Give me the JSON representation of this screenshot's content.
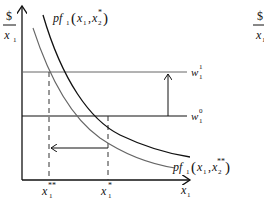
{
  "diagram": {
    "y_axis_label": {
      "numerator": "$",
      "denominator": "x",
      "denominator_sub": "1"
    },
    "x_axis_label": {
      "base": "x",
      "sub": "1"
    },
    "curves": [
      {
        "name": "pf1(x1, x2*)",
        "prefix": "pf",
        "sub": "1",
        "args_open": "(",
        "arg1": "x",
        "arg1_sub": "1",
        "comma": ",",
        "arg2": "x",
        "arg2_sub": "2",
        "arg2_sup": "*",
        "args_close": ")",
        "color": "#111111"
      },
      {
        "name": "pf1(x1, x2**)",
        "prefix": "pf",
        "sub": "1",
        "args_open": "(",
        "arg1": "x",
        "arg1_sub": "1",
        "comma": ",",
        "arg2": "x",
        "arg2_sub": "2",
        "arg2_sup": "**",
        "args_close": ")",
        "color": "#666666"
      }
    ],
    "wage_lines": [
      {
        "label": "w",
        "sub": "1",
        "sup": "1",
        "color": "#666666"
      },
      {
        "label": "w",
        "sub": "1",
        "sup": "0",
        "color": "#111111"
      }
    ],
    "x_ticks": [
      {
        "label": "x",
        "sub": "1",
        "sup": "**"
      },
      {
        "label": "x",
        "sub": "1",
        "sup": "*"
      }
    ],
    "right_partial_label": {
      "numerator": "$",
      "denominator": "x",
      "denominator_sub": "1"
    }
  }
}
